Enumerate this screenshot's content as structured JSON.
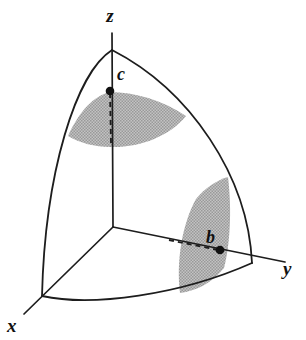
{
  "figure": {
    "background_color": "#ffffff",
    "line_color": "#1d1d1d",
    "shade_color": "#b0b0b0",
    "marker_color": "#111111"
  },
  "axes": [
    {
      "id": "z",
      "label": "z",
      "label_x": 110,
      "label_y": 22,
      "direction": "up"
    },
    {
      "id": "y",
      "label": "y",
      "label_x": 283,
      "label_y": 275,
      "direction": "right-down"
    },
    {
      "id": "x",
      "label": "x",
      "label_x": 7,
      "label_y": 332,
      "direction": "left-down"
    }
  ],
  "points": [
    {
      "id": "c",
      "label": "c",
      "cx": 110,
      "cy": 91,
      "r": 4.3,
      "label_x": 117,
      "label_y": 80,
      "on_axis": "z"
    },
    {
      "id": "b",
      "label": "b",
      "cx": 220,
      "cy": 250,
      "r": 4.3,
      "label_x": 206,
      "label_y": 243,
      "on_axis": "y"
    }
  ],
  "regions": [
    {
      "id": "cone-surface-c",
      "name": "constant-phi cone through c",
      "fill": "#b0b0b0"
    },
    {
      "id": "halfplane-b",
      "name": "constant-theta half plane through b",
      "fill": "#b0b0b0"
    }
  ],
  "origin": {
    "x": 113,
    "y": 227
  },
  "pole": {
    "x": 112,
    "y": 50
  }
}
